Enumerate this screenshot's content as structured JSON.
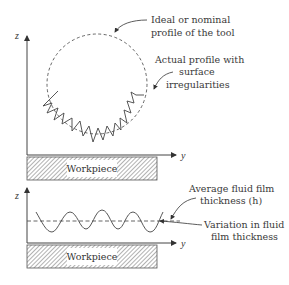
{
  "colors": {
    "line": "#444444",
    "dashed": "#555555",
    "hatch": "#666666",
    "background": "#ffffff"
  },
  "top_panel": {
    "axes": {
      "z_label": "z",
      "y_label": "y"
    },
    "workpiece_label": "Workpiece",
    "annotations": {
      "ideal_profile": [
        "Ideal or nominal",
        "profile of the tool"
      ],
      "actual_profile": [
        "Actual profile with",
        "surface",
        "irregularities"
      ]
    }
  },
  "bottom_panel": {
    "axes": {
      "z_label": "z",
      "y_label": "y"
    },
    "workpiece_label": "Workpiece",
    "annotations": {
      "average_film": [
        "Average fluid film",
        "thickness (h)"
      ],
      "variation_film": [
        "Variation in fluid",
        "film thickness"
      ]
    }
  }
}
